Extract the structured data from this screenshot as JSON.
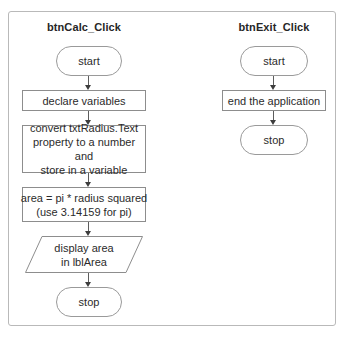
{
  "diagram": {
    "frame_border_color": "#b9b9b9",
    "shape_border_color": "#8d8d8d",
    "connector_color": "#5c5c5c",
    "text_color": "#2b2b2b",
    "background": "#ffffff"
  },
  "columns": [
    {
      "id": "btn-calc",
      "title": "btnCalc_Click",
      "nodes": [
        {
          "id": "calc-start",
          "type": "terminator",
          "label": "start"
        },
        {
          "id": "calc-declare",
          "type": "process",
          "label": "declare variables"
        },
        {
          "id": "calc-convert",
          "type": "process",
          "line1": "convert txtRadius.Text",
          "line2": "property to a number and",
          "line3": "store in a variable"
        },
        {
          "id": "calc-area",
          "type": "process",
          "line1": "area = pi * radius squared",
          "line2": "(use 3.14159 for pi)"
        },
        {
          "id": "calc-display",
          "type": "input-output",
          "line1": "display area",
          "line2": "in lblArea"
        },
        {
          "id": "calc-stop",
          "type": "terminator",
          "label": "stop"
        }
      ]
    },
    {
      "id": "btn-exit",
      "title": "btnExit_Click",
      "nodes": [
        {
          "id": "exit-start",
          "type": "terminator",
          "label": "start"
        },
        {
          "id": "exit-end-app",
          "type": "process",
          "label": "end the application"
        },
        {
          "id": "exit-stop",
          "type": "terminator",
          "label": "stop"
        }
      ]
    }
  ]
}
